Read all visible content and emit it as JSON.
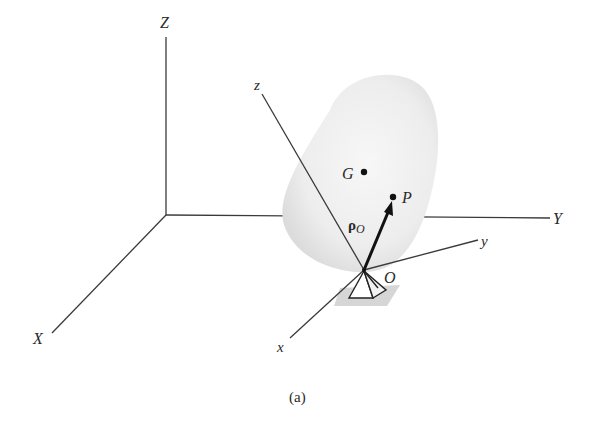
{
  "figure": {
    "caption": "(a)",
    "colors": {
      "line": "#3a3a3a",
      "body_fill": "#ececec",
      "support_shadow": "#d6d6d6",
      "vector": "#111111"
    },
    "global_axes": {
      "Z": "Z",
      "Y": "Y",
      "X": "X"
    },
    "body_axes": {
      "z": "z",
      "y": "y",
      "x": "x"
    },
    "points": {
      "G": "G",
      "P": "P",
      "O": "O"
    },
    "vector": {
      "symbol": "ρ",
      "subscript": "O"
    }
  }
}
